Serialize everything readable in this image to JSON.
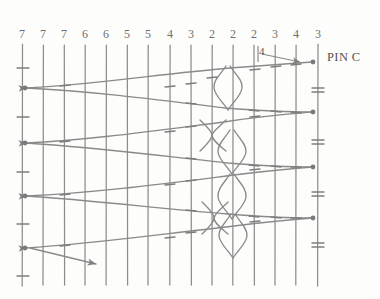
{
  "diagram": {
    "background_color": "#fdfdfc",
    "line_color": "#8a8a8a",
    "text_color": "#6e6e6e",
    "width": 380,
    "height": 299
  },
  "column_labels": {
    "values": [
      "7",
      "7",
      "7",
      "6",
      "6",
      "5",
      "5",
      "4",
      "3",
      "2",
      "2",
      "2",
      "3",
      "4",
      "3"
    ],
    "x_positions": [
      22,
      43,
      64,
      85,
      106,
      127,
      148,
      170,
      191,
      212,
      233,
      254,
      275,
      296,
      318
    ],
    "y": 34
  },
  "grid": {
    "vertical_line_x": [
      22,
      43,
      64,
      85,
      106,
      127,
      148,
      170,
      191,
      212,
      233,
      254,
      275,
      296,
      318
    ],
    "vertical_top": 44,
    "vertical_bottom": 286,
    "tick_rows_y": [
      68,
      117,
      172,
      224,
      276
    ],
    "node_rows_left_y": [
      88,
      143,
      196,
      248
    ],
    "node_rows_right_y": [
      62,
      112,
      167,
      218
    ]
  },
  "annotations": {
    "pin_c": {
      "text": "PIN C",
      "x": 327,
      "y": 57
    },
    "count_four": {
      "text": "4",
      "x": 259,
      "y": 50
    },
    "arrow_bottom_left": {
      "from_x": 30,
      "from_y": 248,
      "to_x": 99,
      "to_y": 265
    }
  },
  "wires": {
    "left_arrow_nodes": [
      {
        "x": 24,
        "y": 88
      },
      {
        "x": 24,
        "y": 143
      },
      {
        "x": 24,
        "y": 196
      },
      {
        "x": 24,
        "y": 248
      }
    ],
    "right_arrow_nodes": [
      {
        "x": 316,
        "y": 62
      },
      {
        "x": 316,
        "y": 112
      },
      {
        "x": 316,
        "y": 167
      },
      {
        "x": 316,
        "y": 218
      }
    ],
    "braid_crossings": [
      {
        "center_x": 228,
        "center_y": 88,
        "half_width": 14,
        "half_height": 20
      },
      {
        "center_x": 212,
        "center_y": 135,
        "half_width": 14,
        "half_height": 18
      },
      {
        "center_x": 232,
        "center_y": 150,
        "half_width": 14,
        "half_height": 20
      },
      {
        "center_x": 232,
        "center_y": 196,
        "half_width": 14,
        "half_height": 20
      },
      {
        "center_x": 214,
        "center_y": 218,
        "half_width": 14,
        "half_height": 18
      },
      {
        "center_x": 233,
        "center_y": 235,
        "half_width": 14,
        "half_height": 20
      }
    ],
    "count": 8
  }
}
